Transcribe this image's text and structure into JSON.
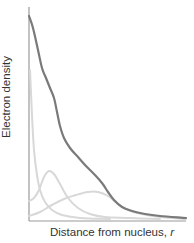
{
  "chart_data": {
    "type": "line",
    "title": "",
    "xlabel": "Distance from nucleus, r",
    "xlabel_text": "Distance from nucleus, ",
    "xlabel_var": "r",
    "ylabel": "Electron density",
    "grid": false,
    "legend": null,
    "axis_ticks": "none",
    "series": [
      {
        "name": "total",
        "color": "#7a7a7a",
        "width": 2.2,
        "points": [
          [
            29,
            16
          ],
          [
            33,
            28
          ],
          [
            38,
            50
          ],
          [
            42,
            68
          ],
          [
            46,
            78
          ],
          [
            50,
            88
          ],
          [
            54,
            98
          ],
          [
            57,
            112
          ],
          [
            60,
            126
          ],
          [
            64,
            138
          ],
          [
            70,
            148
          ],
          [
            78,
            157
          ],
          [
            86,
            166
          ],
          [
            94,
            174
          ],
          [
            102,
            183
          ],
          [
            108,
            192
          ],
          [
            114,
            200
          ],
          [
            122,
            207
          ],
          [
            132,
            211
          ],
          [
            145,
            214
          ],
          [
            160,
            216
          ],
          [
            186,
            218
          ]
        ]
      },
      {
        "name": "1s",
        "color": "#d8d8d8",
        "width": 2,
        "points": [
          [
            30,
            70
          ],
          [
            32,
            115
          ],
          [
            34,
            150
          ],
          [
            37,
            175
          ],
          [
            40,
            190
          ],
          [
            45,
            202
          ],
          [
            52,
            210
          ],
          [
            62,
            215
          ],
          [
            80,
            218
          ],
          [
            110,
            219
          ]
        ]
      },
      {
        "name": "2s",
        "color": "#d8d8d8",
        "width": 2,
        "points": [
          [
            29,
            201
          ],
          [
            34,
            198
          ],
          [
            39,
            190
          ],
          [
            44,
            177
          ],
          [
            49,
            171
          ],
          [
            54,
            174
          ],
          [
            60,
            184
          ],
          [
            68,
            198
          ],
          [
            78,
            208
          ],
          [
            90,
            214
          ],
          [
            105,
            217
          ],
          [
            130,
            218
          ],
          [
            160,
            219
          ]
        ]
      },
      {
        "name": "3s",
        "color": "#d8d8d8",
        "width": 2,
        "points": [
          [
            29,
            216
          ],
          [
            40,
            212
          ],
          [
            52,
            205
          ],
          [
            64,
            199
          ],
          [
            76,
            195
          ],
          [
            88,
            192
          ],
          [
            98,
            192
          ],
          [
            108,
            196
          ],
          [
            118,
            204
          ],
          [
            128,
            210
          ],
          [
            142,
            214
          ],
          [
            160,
            217
          ],
          [
            186,
            219
          ]
        ]
      }
    ],
    "axes": {
      "color": "#9a9a9a",
      "origin": [
        29,
        221
      ],
      "y_top": 7,
      "x_right": 186
    }
  }
}
